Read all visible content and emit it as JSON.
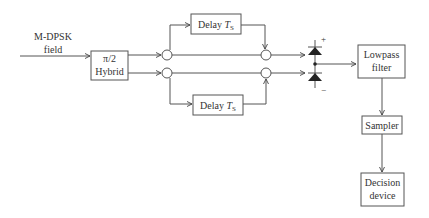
{
  "diagram": {
    "input": {
      "line1": "M-DPSK",
      "line2": "field"
    },
    "hybrid": {
      "line1": "π/2",
      "line2": "Hybrid"
    },
    "delay_top": {
      "text": "Delay ",
      "var": "T",
      "sub": "S"
    },
    "delay_bottom": {
      "text": "Delay ",
      "var": "T",
      "sub": "S"
    },
    "photodiode": {
      "plus": "+",
      "minus": "−"
    },
    "lowpass": {
      "line1": "Lowpass",
      "line2": "filter"
    },
    "sampler": {
      "label": "Sampler"
    },
    "decision": {
      "line1": "Decision",
      "line2": "device"
    }
  }
}
